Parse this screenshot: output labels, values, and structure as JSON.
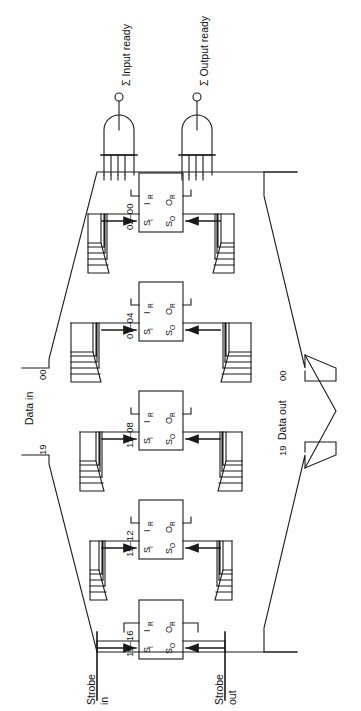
{
  "figure": {
    "type": "logic-block-diagram",
    "orientation": "rotated-90-ccw"
  },
  "signals": {
    "input_ready": "Σ Input ready",
    "output_ready": "Σ Output ready",
    "data_in": "Data in",
    "data_out": "Data out",
    "strobe_in_line1": "Strobe",
    "strobe_in_line2": "in",
    "strobe_out_line1": "Strobe",
    "strobe_out_line2": "out"
  },
  "bus_labels": {
    "data_in_msb": "19",
    "data_in_lsb": "00",
    "data_out_msb": "19",
    "data_out_lsb": "00"
  },
  "registers": [
    {
      "id": "reg-03-00",
      "label": "03–00",
      "pins": {
        "si": "S",
        "si_sub": "I",
        "ir": "I",
        "ir_sub": "R",
        "or": "O",
        "or_sub": "R",
        "so": "S",
        "so_sub": "O"
      }
    },
    {
      "id": "reg-07-04",
      "label": "07–04",
      "pins": {
        "si": "S",
        "si_sub": "I",
        "ir": "I",
        "ir_sub": "R",
        "or": "O",
        "or_sub": "R",
        "so": "S",
        "so_sub": "O"
      }
    },
    {
      "id": "reg-11-08",
      "label": "11–08",
      "pins": {
        "si": "S",
        "si_sub": "I",
        "ir": "I",
        "ir_sub": "R",
        "or": "O",
        "or_sub": "R",
        "so": "S",
        "so_sub": "O"
      }
    },
    {
      "id": "reg-15-12",
      "label": "15–12",
      "pins": {
        "si": "S",
        "si_sub": "I",
        "ir": "I",
        "ir_sub": "R",
        "or": "O",
        "or_sub": "R",
        "so": "S",
        "so_sub": "O"
      }
    },
    {
      "id": "reg-19-16",
      "label": "19–16",
      "pins": {
        "si": "S",
        "si_sub": "I",
        "ir": "I",
        "ir_sub": "R",
        "or": "O",
        "or_sub": "R",
        "so": "S",
        "so_sub": "O"
      }
    }
  ],
  "gates": [
    {
      "id": "and-gate-input-ready",
      "kind": "and-gate",
      "inputs": 5,
      "output_terminal": "open-circle"
    },
    {
      "id": "and-gate-output-ready",
      "kind": "and-gate",
      "inputs": 5,
      "output_terminal": "open-circle"
    }
  ],
  "colors": {
    "line": "#1a1a1a",
    "text": "#111111",
    "background": "#ffffff"
  }
}
